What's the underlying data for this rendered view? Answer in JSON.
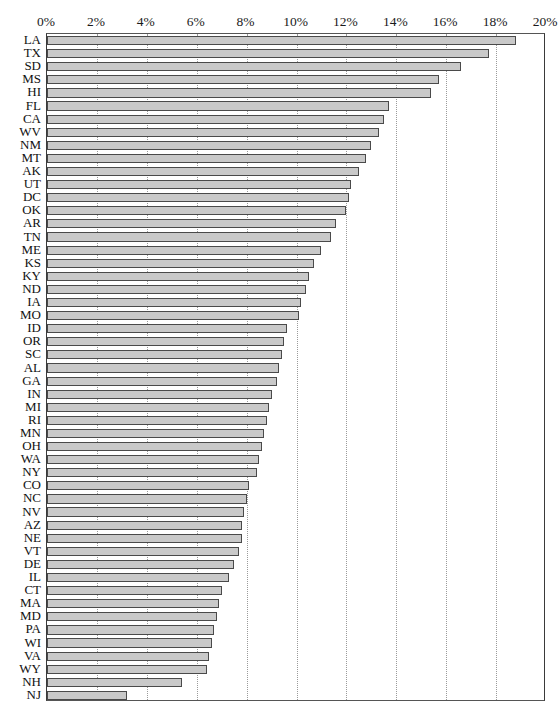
{
  "chart_data": {
    "type": "bar",
    "orientation": "horizontal",
    "title": "",
    "subtitle": "",
    "xlabel": "",
    "ylabel": "",
    "xlim": [
      0,
      20
    ],
    "ylim": null,
    "x_unit": "%",
    "grid": true,
    "grid_axis": "x",
    "grid_style": "dotted",
    "legend": null,
    "legend_position": "none",
    "axis_ticks": [
      {
        "value": 0,
        "label": "0%"
      },
      {
        "value": 2,
        "label": "2%"
      },
      {
        "value": 4,
        "label": "4%"
      },
      {
        "value": 6,
        "label": "6%"
      },
      {
        "value": 8,
        "label": "8%"
      },
      {
        "value": 10,
        "label": "10%"
      },
      {
        "value": 12,
        "label": "12%"
      },
      {
        "value": 14,
        "label": "14%"
      },
      {
        "value": 16,
        "label": "16%"
      },
      {
        "value": 18,
        "label": "18%"
      },
      {
        "value": 20,
        "label": "20%"
      }
    ],
    "bar_color": "#c9c9c9",
    "bar_border_color": "#4a4a4a",
    "categories": [
      "LA",
      "TX",
      "SD",
      "MS",
      "HI",
      "FL",
      "CA",
      "WV",
      "NM",
      "MT",
      "AK",
      "UT",
      "DC",
      "OK",
      "AR",
      "TN",
      "ME",
      "KS",
      "KY",
      "ND",
      "IA",
      "MO",
      "ID",
      "OR",
      "SC",
      "AL",
      "GA",
      "IN",
      "MI",
      "RI",
      "MN",
      "OH",
      "WA",
      "NY",
      "CO",
      "NC",
      "NV",
      "AZ",
      "NE",
      "VT",
      "DE",
      "IL",
      "CT",
      "MA",
      "MD",
      "PA",
      "WI",
      "VA",
      "WY",
      "NH",
      "NJ"
    ],
    "values": [
      18.8,
      17.7,
      16.6,
      15.7,
      15.4,
      13.7,
      13.5,
      13.3,
      13.0,
      12.8,
      12.5,
      12.2,
      12.1,
      12.0,
      11.6,
      11.4,
      11.0,
      10.7,
      10.5,
      10.4,
      10.2,
      10.1,
      9.6,
      9.5,
      9.4,
      9.3,
      9.2,
      9.0,
      8.9,
      8.8,
      8.7,
      8.6,
      8.5,
      8.4,
      8.1,
      8.0,
      7.9,
      7.8,
      7.8,
      7.7,
      7.5,
      7.3,
      7.0,
      6.9,
      6.8,
      6.7,
      6.6,
      6.5,
      6.4,
      5.4,
      3.2
    ],
    "series": [
      {
        "name": "Rate",
        "values": [
          18.8,
          17.7,
          16.6,
          15.7,
          15.4,
          13.7,
          13.5,
          13.3,
          13.0,
          12.8,
          12.5,
          12.2,
          12.1,
          12.0,
          11.6,
          11.4,
          11.0,
          10.7,
          10.5,
          10.4,
          10.2,
          10.1,
          9.6,
          9.5,
          9.4,
          9.3,
          9.2,
          9.0,
          8.9,
          8.8,
          8.7,
          8.6,
          8.5,
          8.4,
          8.1,
          8.0,
          7.9,
          7.8,
          7.8,
          7.7,
          7.5,
          7.3,
          7.0,
          6.9,
          6.8,
          6.7,
          6.6,
          6.5,
          6.4,
          5.4,
          3.2
        ]
      }
    ]
  }
}
